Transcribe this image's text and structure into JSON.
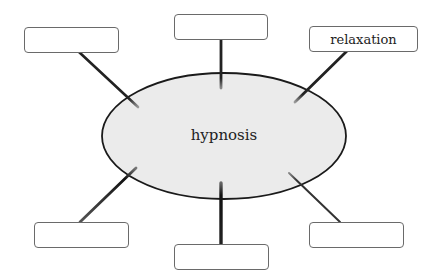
{
  "diagram": {
    "type": "spider-map",
    "center": {
      "label": "hypnosis",
      "fill": "#ebebeb",
      "stroke": "#1a1a1a"
    },
    "nodes": [
      {
        "id": "top-left",
        "label": ""
      },
      {
        "id": "top-center",
        "label": ""
      },
      {
        "id": "top-right",
        "label": "relaxation"
      },
      {
        "id": "bottom-left",
        "label": ""
      },
      {
        "id": "bottom-center",
        "label": ""
      },
      {
        "id": "bottom-right",
        "label": ""
      }
    ]
  }
}
